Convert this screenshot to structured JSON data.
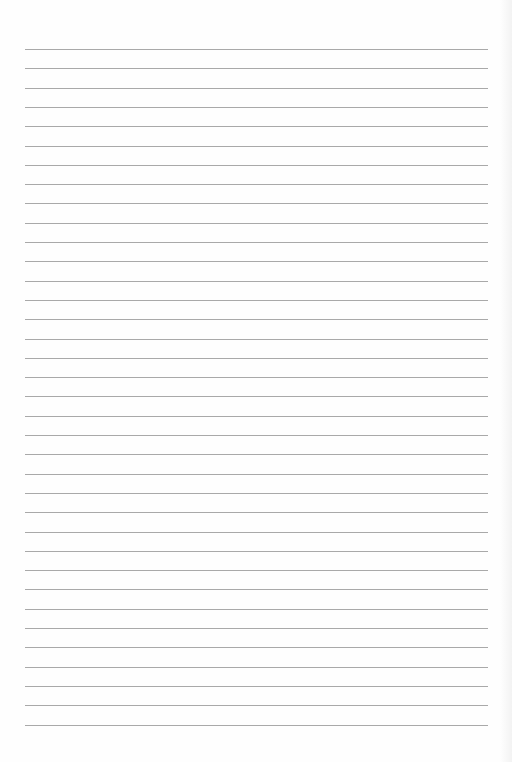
{
  "document": {
    "type": "lined-paper",
    "line_count": 36,
    "first_line_y": 49,
    "line_spacing": 19.3,
    "line_left": 25,
    "line_right": 488,
    "line_color": "#9a9a9a",
    "background_color": "#fefefe",
    "text": []
  }
}
